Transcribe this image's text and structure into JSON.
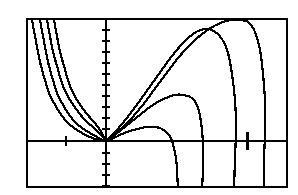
{
  "figure": {
    "kind": "graphing-calculator-plot",
    "background_color": "#ffffff",
    "ink_color": "#000000",
    "frame": {
      "name": "plot-frame",
      "x": 26,
      "y": 18,
      "width": 262,
      "height": 170,
      "border_width": 2,
      "border_color": "#000000"
    },
    "title": "",
    "axis_labels_visible": false,
    "tick_labels_visible": false,
    "legend_visible": false
  },
  "chart_data": {
    "type": "line",
    "title": "",
    "xlabel": "",
    "ylabel": "",
    "grid": false,
    "legend": "none",
    "xlim": [
      -2.0,
      5.0
    ],
    "ylim": [
      -2.6,
      3.1
    ],
    "axes": {
      "x_axis": {
        "name": "x-axis",
        "orientation": "horizontal",
        "pixel_y": 139,
        "value": 0,
        "ticks_pixel_x": [
          64,
          245
        ],
        "tick_values": [
          -1,
          3
        ],
        "tick_length": 8
      },
      "y_axis": {
        "name": "y-axis",
        "orientation": "vertical",
        "pixel_x": 104,
        "value": 0,
        "ticks_pixel_y": [
          28,
          39,
          50,
          61,
          72,
          83,
          94,
          105,
          116,
          127,
          151,
          162,
          173,
          184
        ],
        "tick_values": [
          2.0,
          1.8,
          1.6,
          1.4,
          1.2,
          1.0,
          0.8,
          0.6,
          0.4,
          0.2,
          -0.2,
          -0.4,
          -0.6,
          -0.8
        ],
        "tick_length": 6
      },
      "origin_pixel": [
        104,
        139
      ]
    },
    "series": [
      {
        "name": "curve-1",
        "description": "smallest amplitude cubic through origin",
        "peak_pixel": [
          148,
          125
        ],
        "peak_value": [
          0.95,
          0.26
        ],
        "top_exit_pixel_x": 30,
        "bottom_exit_pixel_x": 176,
        "points_pixel": [
          [
            30,
            18
          ],
          [
            33,
            34
          ],
          [
            36,
            50
          ],
          [
            39,
            64
          ],
          [
            43,
            78
          ],
          [
            47,
            91
          ],
          [
            52,
            101
          ],
          [
            58,
            111
          ],
          [
            65,
            120
          ],
          [
            72,
            126
          ],
          [
            80,
            131
          ],
          [
            88,
            135
          ],
          [
            96,
            138
          ],
          [
            104,
            139
          ],
          [
            112,
            136
          ],
          [
            120,
            132
          ],
          [
            128,
            129
          ],
          [
            136,
            127
          ],
          [
            144,
            125
          ],
          [
            152,
            125
          ],
          [
            158,
            126
          ],
          [
            163,
            129
          ],
          [
            167,
            133
          ],
          [
            170,
            139
          ],
          [
            172,
            146
          ],
          [
            174,
            156
          ],
          [
            175,
            168
          ],
          [
            176,
            188
          ]
        ]
      },
      {
        "name": "curve-2",
        "description": "second amplitude cubic through origin",
        "peak_pixel": [
          175,
          93
        ],
        "peak_value": [
          1.73,
          0.84
        ],
        "top_exit_pixel_x": 38,
        "bottom_exit_pixel_x": 200,
        "points_pixel": [
          [
            38,
            18
          ],
          [
            41,
            34
          ],
          [
            44,
            50
          ],
          [
            47,
            64
          ],
          [
            51,
            78
          ],
          [
            55,
            91
          ],
          [
            60,
            101
          ],
          [
            66,
            111
          ],
          [
            73,
            120
          ],
          [
            80,
            126
          ],
          [
            88,
            131
          ],
          [
            95,
            135
          ],
          [
            100,
            138
          ],
          [
            104,
            139
          ],
          [
            114,
            132
          ],
          [
            124,
            124
          ],
          [
            134,
            116
          ],
          [
            144,
            108
          ],
          [
            154,
            101
          ],
          [
            164,
            96
          ],
          [
            172,
            93
          ],
          [
            182,
            93
          ],
          [
            190,
            96
          ],
          [
            195,
            103
          ],
          [
            198,
            114
          ],
          [
            200,
            128
          ],
          [
            201,
            144
          ],
          [
            201,
            166
          ],
          [
            200,
            188
          ]
        ]
      },
      {
        "name": "curve-3",
        "description": "third amplitude cubic through origin",
        "peak_pixel": [
          203,
          27
        ],
        "peak_value": [
          2.64,
          2.04
        ],
        "top_exit_pixel_x": 45,
        "bottom_exit_pixel_x": 232,
        "points_pixel": [
          [
            45,
            18
          ],
          [
            48,
            34
          ],
          [
            51,
            50
          ],
          [
            55,
            64
          ],
          [
            59,
            78
          ],
          [
            64,
            91
          ],
          [
            70,
            101
          ],
          [
            77,
            111
          ],
          [
            85,
            120
          ],
          [
            92,
            126
          ],
          [
            98,
            132
          ],
          [
            102,
            136
          ],
          [
            104,
            139
          ],
          [
            114,
            129
          ],
          [
            124,
            117
          ],
          [
            134,
            104
          ],
          [
            144,
            90
          ],
          [
            154,
            76
          ],
          [
            164,
            62
          ],
          [
            174,
            49
          ],
          [
            184,
            38
          ],
          [
            194,
            30
          ],
          [
            203,
            27
          ],
          [
            212,
            29
          ],
          [
            220,
            37
          ],
          [
            226,
            51
          ],
          [
            230,
            72
          ],
          [
            233,
            98
          ],
          [
            234,
            126
          ],
          [
            233,
            156
          ],
          [
            232,
            188
          ]
        ]
      },
      {
        "name": "curve-4",
        "description": "fourth amplitude cubic through origin, steepest right branch",
        "peak_pixel": [
          247,
          20
        ],
        "peak_value": [
          3.05,
          2.5
        ],
        "top_exit_pixel_x": 52,
        "bottom_exit_pixel_x": 262,
        "points_pixel": [
          [
            52,
            18
          ],
          [
            55,
            34
          ],
          [
            58,
            50
          ],
          [
            62,
            64
          ],
          [
            66,
            78
          ],
          [
            71,
            91
          ],
          [
            77,
            101
          ],
          [
            84,
            111
          ],
          [
            92,
            120
          ],
          [
            98,
            128
          ],
          [
            102,
            135
          ],
          [
            104,
            139
          ],
          [
            116,
            130
          ],
          [
            128,
            118
          ],
          [
            140,
            104
          ],
          [
            152,
            88
          ],
          [
            164,
            72
          ],
          [
            176,
            56
          ],
          [
            188,
            43
          ],
          [
            200,
            32
          ],
          [
            212,
            24
          ],
          [
            224,
            19
          ],
          [
            236,
            18
          ],
          [
            246,
            20
          ],
          [
            253,
            30
          ],
          [
            258,
            48
          ],
          [
            261,
            72
          ],
          [
            263,
            100
          ],
          [
            263,
            130
          ],
          [
            262,
            160
          ],
          [
            262,
            188
          ]
        ]
      }
    ]
  }
}
